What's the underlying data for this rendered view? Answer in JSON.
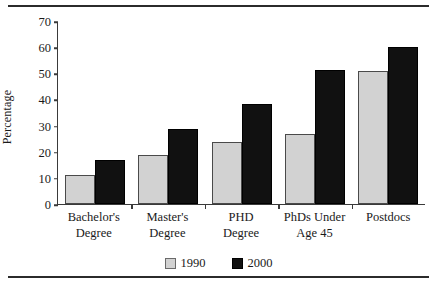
{
  "chart_data": {
    "type": "bar",
    "title": "",
    "xlabel": "",
    "ylabel": "Percentage",
    "ylim": [
      0,
      70
    ],
    "yticks": [
      0,
      10,
      20,
      30,
      40,
      50,
      60,
      70
    ],
    "grid": false,
    "legend_position": "bottom-center",
    "categories": [
      "Bachelor's\nDegree",
      "Master's\nDegree",
      "PHD\nDegree",
      "PhDs Under\nAge 45",
      "Postdocs"
    ],
    "category_lines": [
      [
        "Bachelor's",
        "Degree"
      ],
      [
        "Master's",
        "Degree"
      ],
      [
        "PHD",
        "Degree"
      ],
      [
        "PhDs Under",
        "Age 45"
      ],
      [
        "Postdocs",
        ""
      ]
    ],
    "series": [
      {
        "name": "1990",
        "color": "#d2d2d2",
        "values": [
          11,
          19,
          24,
          27,
          51
        ]
      },
      {
        "name": "2000",
        "color": "#111111",
        "values": [
          17,
          29,
          38.5,
          51.5,
          60.5
        ]
      }
    ]
  },
  "legend": {
    "items": [
      {
        "label": "1990"
      },
      {
        "label": "2000"
      }
    ]
  }
}
